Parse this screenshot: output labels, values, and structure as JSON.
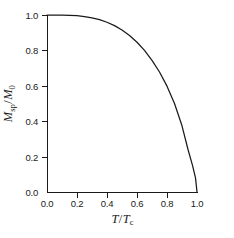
{
  "chart_data": {
    "type": "line",
    "title": "",
    "subtitle": "",
    "xlabel_text": "T/Tc",
    "ylabel_text": "Msp/M0",
    "xlabel_parts": {
      "num": "T",
      "den": "T",
      "den_sub": "c"
    },
    "ylabel_parts": {
      "num": "M",
      "num_sub": "sp",
      "den": "M",
      "den_sub": "0"
    },
    "xlim": [
      0.0,
      1.0
    ],
    "ylim": [
      0.0,
      1.0
    ],
    "grid": false,
    "legend": null,
    "legend_position": "none",
    "annotations": [],
    "xticklabels": [
      "0.0",
      "0.2",
      "0.4",
      "0.6",
      "0.8",
      "1.0"
    ],
    "xticks": [
      0.0,
      0.2,
      0.4,
      0.6,
      0.8,
      1.0
    ],
    "yticklabels": [
      "0.0",
      "0.2",
      "0.4",
      "0.6",
      "0.8",
      "1.0"
    ],
    "yticks": [
      0.0,
      0.2,
      0.4,
      0.6,
      0.8,
      1.0
    ],
    "series": [
      {
        "name": "spontaneous magnetization",
        "color": "#1a1a1a",
        "x": [
          0.0,
          0.05,
          0.1,
          0.15,
          0.2,
          0.25,
          0.3,
          0.35,
          0.4,
          0.45,
          0.5,
          0.55,
          0.6,
          0.65,
          0.7,
          0.75,
          0.8,
          0.85,
          0.9,
          0.94,
          0.97,
          0.99,
          1.0
        ],
        "y": [
          1.0,
          1.0,
          0.999,
          0.998,
          0.996,
          0.991,
          0.984,
          0.974,
          0.959,
          0.94,
          0.915,
          0.884,
          0.846,
          0.8,
          0.744,
          0.678,
          0.598,
          0.5,
          0.374,
          0.24,
          0.15,
          0.08,
          0.0
        ]
      }
    ]
  },
  "axes": {
    "x": {
      "label_plain": "T/Tc",
      "ticks": [
        {
          "value": 0.0,
          "label": "0.0"
        },
        {
          "value": 0.2,
          "label": "0.2"
        },
        {
          "value": 0.4,
          "label": "0.4"
        },
        {
          "value": 0.6,
          "label": "0.6"
        },
        {
          "value": 0.8,
          "label": "0.8"
        },
        {
          "value": 1.0,
          "label": "1.0"
        }
      ]
    },
    "y": {
      "label_plain": "Msp/M0",
      "ticks": [
        {
          "value": 1.0,
          "label": "1.0"
        },
        {
          "value": 0.8,
          "label": "0.8"
        },
        {
          "value": 0.6,
          "label": "0.6"
        },
        {
          "value": 0.4,
          "label": "0.4"
        },
        {
          "value": 0.2,
          "label": "0.2"
        },
        {
          "value": 0.0,
          "label": "0.0"
        }
      ]
    }
  },
  "style": {
    "axis_color": "#1a1a1a",
    "curve_color": "#1a1a1a",
    "background": "#ffffff"
  }
}
